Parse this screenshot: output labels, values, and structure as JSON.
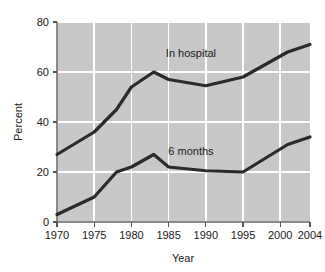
{
  "chart_data": {
    "type": "line",
    "title": "",
    "xlabel": "Year",
    "ylabel": "Percent",
    "xlim": [
      1970,
      2004
    ],
    "ylim": [
      0,
      80
    ],
    "grid": true,
    "legend_position": "inline-annotation",
    "xticks": [
      1970,
      1975,
      1980,
      1985,
      1990,
      1995,
      2000,
      2004
    ],
    "xtick_labels": [
      "1970",
      "1975",
      "1980",
      "1985",
      "1990",
      "1995",
      "2000",
      "2004"
    ],
    "yticks": [
      0,
      20,
      40,
      60,
      80
    ],
    "ytick_labels": [
      "0",
      "20",
      "40",
      "60",
      "80"
    ],
    "series": [
      {
        "name": "In hospital",
        "label_x": 1988,
        "label_y": 66,
        "x": [
          1970,
          1975,
          1978,
          1980,
          1983,
          1985,
          1990,
          1995,
          2001,
          2004
        ],
        "values": [
          27,
          36,
          45,
          54,
          60,
          57,
          54.5,
          58,
          68,
          71
        ]
      },
      {
        "name": "6 months",
        "label_x": 1988,
        "label_y": 27,
        "x": [
          1970,
          1975,
          1978,
          1980,
          1983,
          1985,
          1990,
          1995,
          2001,
          2004
        ],
        "values": [
          3,
          10,
          20,
          22,
          27,
          22,
          20.5,
          20,
          31,
          34
        ]
      }
    ],
    "colors": {
      "plot_background": "#c8c8c8",
      "page_background": "#ffffff",
      "gridline": "#ffffff",
      "line": "#2b2b2b",
      "axis": "#8a8a8a",
      "text": "#1a1a1a"
    }
  }
}
